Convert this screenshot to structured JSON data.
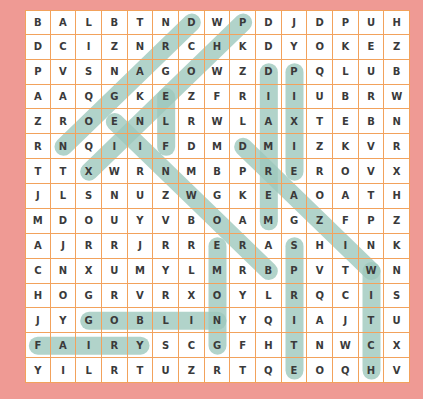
{
  "puzzle": {
    "rows": 15,
    "cols": 15,
    "highlight_color": "#9ec9bd",
    "grid": [
      [
        "B",
        "A",
        "L",
        "B",
        "T",
        "N",
        "D",
        "W",
        "P",
        "D",
        "J",
        "D",
        "P",
        "U",
        "H"
      ],
      [
        "D",
        "C",
        "I",
        "Z",
        "N",
        "R",
        "C",
        "H",
        "K",
        "D",
        "Y",
        "O",
        "K",
        "E",
        "Z"
      ],
      [
        "P",
        "V",
        "S",
        "N",
        "A",
        "G",
        "O",
        "W",
        "Z",
        "D",
        "P",
        "Q",
        "L",
        "U",
        "B"
      ],
      [
        "A",
        "A",
        "Q",
        "G",
        "K",
        "E",
        "Z",
        "F",
        "R",
        "I",
        "I",
        "U",
        "B",
        "R",
        "W"
      ],
      [
        "Z",
        "R",
        "O",
        "E",
        "N",
        "L",
        "R",
        "W",
        "L",
        "A",
        "X",
        "T",
        "E",
        "B",
        "N"
      ],
      [
        "R",
        "N",
        "Q",
        "I",
        "I",
        "F",
        "D",
        "M",
        "D",
        "M",
        "I",
        "Z",
        "K",
        "V",
        "R"
      ],
      [
        "T",
        "T",
        "X",
        "W",
        "R",
        "N",
        "M",
        "B",
        "P",
        "R",
        "E",
        "R",
        "O",
        "V",
        "X"
      ],
      [
        "J",
        "L",
        "S",
        "N",
        "U",
        "Z",
        "W",
        "G",
        "K",
        "E",
        "A",
        "O",
        "A",
        "T",
        "H"
      ],
      [
        "M",
        "D",
        "O",
        "U",
        "Y",
        "V",
        "B",
        "O",
        "A",
        "M",
        "G",
        "Z",
        "F",
        "P",
        "Z"
      ],
      [
        "A",
        "J",
        "R",
        "R",
        "J",
        "R",
        "R",
        "E",
        "R",
        "A",
        "S",
        "H",
        "I",
        "N",
        "K"
      ],
      [
        "C",
        "N",
        "X",
        "U",
        "M",
        "Y",
        "L",
        "M",
        "R",
        "B",
        "P",
        "V",
        "T",
        "W",
        "N"
      ],
      [
        "H",
        "O",
        "G",
        "R",
        "V",
        "R",
        "X",
        "O",
        "Y",
        "L",
        "R",
        "Q",
        "C",
        "I",
        "S"
      ],
      [
        "J",
        "Y",
        "G",
        "O",
        "B",
        "L",
        "I",
        "N",
        "Y",
        "Q",
        "I",
        "A",
        "J",
        "T",
        "U"
      ],
      [
        "F",
        "A",
        "I",
        "R",
        "Y",
        "S",
        "C",
        "G",
        "F",
        "H",
        "T",
        "N",
        "W",
        "C",
        "X"
      ],
      [
        "Y",
        "I",
        "L",
        "R",
        "T",
        "U",
        "Z",
        "R",
        "T",
        "Q",
        "E",
        "O",
        "Q",
        "H",
        "V"
      ]
    ],
    "found_words": [
      {
        "word": "FAIRY",
        "start": [
          13,
          0
        ],
        "end": [
          13,
          4
        ]
      },
      {
        "word": "GOBLIN",
        "start": [
          12,
          2
        ],
        "end": [
          12,
          7
        ]
      },
      {
        "word": "WITCH",
        "start": [
          10,
          13
        ],
        "end": [
          14,
          13
        ]
      },
      {
        "word": "SPRITE",
        "start": [
          9,
          10
        ],
        "end": [
          14,
          10
        ]
      },
      {
        "word": "GNOME",
        "start": [
          13,
          7
        ],
        "end": [
          9,
          7
        ]
      },
      {
        "word": "MERMAID",
        "start": [
          8,
          9
        ],
        "end": [
          2,
          9
        ]
      },
      {
        "word": "PIXIE",
        "start": [
          2,
          10
        ],
        "end": [
          6,
          10
        ]
      },
      {
        "word": "PHOENIX",
        "start": [
          0,
          8
        ],
        "end": [
          6,
          2
        ]
      },
      {
        "word": "DRAGON",
        "start": [
          0,
          6
        ],
        "end": [
          5,
          1
        ]
      },
      {
        "word": "ELF",
        "start": [
          3,
          5
        ],
        "end": [
          5,
          5
        ]
      },
      {
        "word": "WIZARD",
        "start": [
          10,
          13
        ],
        "end": [
          5,
          8
        ]
      },
      {
        "word": "BROWNIE",
        "start": [
          10,
          9
        ],
        "end": [
          4,
          3
        ]
      }
    ]
  }
}
